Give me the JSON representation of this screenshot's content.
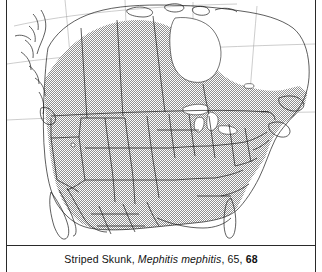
{
  "figure": {
    "kind": "range-map-plate",
    "width": 322,
    "height": 272,
    "frame_color": "#2a2a2a"
  },
  "caption": {
    "common_name": "Striped Skunk",
    "separator_1": ", ",
    "scientific_name": "Mephitis mephitis",
    "separator_2": ", ",
    "page_ref_plain": "65",
    "separator_3": ", ",
    "page_ref_bold": "68",
    "full_text": "Striped Skunk, Mephitis mephitis, 65, 68"
  },
  "map": {
    "title": "North America distribution",
    "region": "North America",
    "projection_note": "conic, graticule shown",
    "land_outline_color": "#1a1a1a",
    "boundary_color": "#1a1a1a",
    "graticule_color": "#8a8a8a",
    "water_fill": "#ffffff",
    "range_fill_pattern": "stipple-screen",
    "range_fill_color": "#9a9a9a",
    "legend_note": "shaded area = species range",
    "range_included": [
      "Conterminous United States",
      "Southern and central Canada",
      "Northern Mexico",
      "Nova Scotia and New Brunswick"
    ],
    "range_excluded": [
      "Arctic Canada",
      "Hudson Bay",
      "Great Lakes",
      "Newfoundland",
      "Baja California",
      "Southern Florida",
      "Coastal British Columbia islands",
      "Alaska panhandle"
    ]
  }
}
